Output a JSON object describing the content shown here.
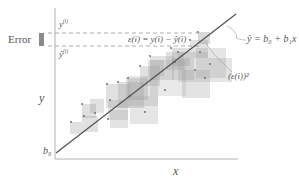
{
  "diagram": {
    "labels": {
      "error": "Error",
      "y_i": "y",
      "y_i_sup": "(i)",
      "yhat_i": "ŷ",
      "yhat_i_sup": "(i)",
      "residual_formula": "ε(i) = y(i) − ŷ(i)",
      "regression_eq": "ŷ = b₀ + b₁x",
      "squared_error": "(ε(i))²",
      "y_axis": "y",
      "x_axis": "x",
      "intercept": "b₀"
    },
    "colors": {
      "axis": "#aaaaaa",
      "line": "#555555",
      "dashed": "#999999",
      "square_fill": "#9a9a9a",
      "error_bar": "#8a8a8a",
      "text": "#555555"
    },
    "regression_line": {
      "x1": 56,
      "y1": 153,
      "x2": 236,
      "y2": 14
    },
    "squares": [
      {
        "x": 70,
        "y": 122,
        "s": 12,
        "o": 0.3
      },
      {
        "x": 82,
        "y": 116,
        "s": 16,
        "o": 0.3
      },
      {
        "x": 82,
        "y": 104,
        "s": 14,
        "o": 0.32
      },
      {
        "x": 90,
        "y": 99,
        "s": 14,
        "o": 0.3
      },
      {
        "x": 106,
        "y": 84,
        "s": 24,
        "o": 0.3
      },
      {
        "x": 108,
        "y": 100,
        "s": 20,
        "o": 0.28
      },
      {
        "x": 110,
        "y": 110,
        "s": 18,
        "o": 0.28
      },
      {
        "x": 118,
        "y": 82,
        "s": 26,
        "o": 0.3
      },
      {
        "x": 126,
        "y": 78,
        "s": 22,
        "o": 0.32
      },
      {
        "x": 130,
        "y": 96,
        "s": 28,
        "o": 0.25
      },
      {
        "x": 128,
        "y": 76,
        "s": 30,
        "o": 0.26
      },
      {
        "x": 140,
        "y": 66,
        "s": 20,
        "o": 0.3
      },
      {
        "x": 148,
        "y": 60,
        "s": 16,
        "o": 0.3
      },
      {
        "x": 150,
        "y": 56,
        "s": 24,
        "o": 0.28
      },
      {
        "x": 150,
        "y": 60,
        "s": 36,
        "o": 0.22
      },
      {
        "x": 166,
        "y": 52,
        "s": 18,
        "o": 0.3
      },
      {
        "x": 172,
        "y": 48,
        "s": 18,
        "o": 0.32
      },
      {
        "x": 178,
        "y": 52,
        "s": 30,
        "o": 0.25
      },
      {
        "x": 172,
        "y": 58,
        "s": 22,
        "o": 0.28
      },
      {
        "x": 182,
        "y": 70,
        "s": 28,
        "o": 0.28
      },
      {
        "x": 190,
        "y": 40,
        "s": 18,
        "o": 0.3
      },
      {
        "x": 196,
        "y": 48,
        "s": 30,
        "o": 0.26
      },
      {
        "x": 208,
        "y": 58,
        "s": 24,
        "o": 0.26
      },
      {
        "x": 198,
        "y": 32,
        "s": 12,
        "o": 0.38
      }
    ],
    "points": [
      [
        71,
        122
      ],
      [
        84,
        116
      ],
      [
        82,
        104
      ],
      [
        95,
        113
      ],
      [
        107,
        84
      ],
      [
        110,
        100
      ],
      [
        108,
        119
      ],
      [
        118,
        82
      ],
      [
        128,
        78
      ],
      [
        130,
        96
      ],
      [
        145,
        112
      ],
      [
        140,
        66
      ],
      [
        150,
        56
      ],
      [
        165,
        90
      ],
      [
        171,
        48
      ],
      [
        178,
        52
      ],
      [
        175,
        62
      ],
      [
        190,
        40
      ],
      [
        200,
        52
      ],
      [
        205,
        78
      ],
      [
        195,
        70
      ],
      [
        210,
        64
      ],
      [
        198,
        32
      ]
    ]
  }
}
